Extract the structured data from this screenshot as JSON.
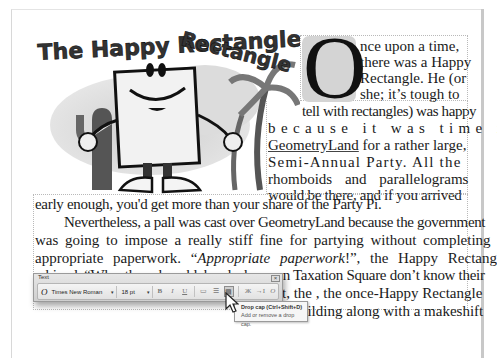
{
  "document": {
    "art_title": "The Happy Rectangle",
    "drop_cap_letter": "O",
    "right_column_lines": [
      "nce upon a time,",
      "there was a Happy",
      "Rectangle. He (or",
      "she; it’s tough to",
      "tell with rectangles) was happy"
    ],
    "mid_column_lines": [
      "because it was time in",
      "GeometryLand for a rather large,",
      "Semi-Annual Party. All the",
      "rhomboids and parallelograms",
      "would be there, and if you arrived"
    ],
    "mid_link_word": "GeometryLand",
    "main_lines": [
      "early enough, you'd get more than your share of the Party Pi.",
      "Nevertheless, a pall was cast over GeometryLand because the government",
      "was going to impose a really stiff fine for partying without completing the",
      "appropriate paperwork.",
      "“",
      "Appropriate paperwork",
      "!”, the Happy Rectangle",
      "whined. “Why, those knuckleheads down on Taxation Square don’t know their",
      "t, the , the once-Happy Rectangle",
      "e building along with a makeshift"
    ]
  },
  "toolbar": {
    "title": "Text",
    "close_label": "×",
    "font_icon": "O",
    "font_name": "Times New Roman",
    "font_size": "18 pt",
    "dropdown_caret": "▾",
    "buttons": [
      {
        "name": "bold-button",
        "glyph": "B"
      },
      {
        "name": "italic-button",
        "glyph": "I"
      },
      {
        "name": "underline-button",
        "glyph": "U"
      },
      {
        "name": "highlight-button",
        "glyph": "▭"
      },
      {
        "name": "bullets-button",
        "glyph": "☰"
      },
      {
        "name": "drop-cap-button",
        "glyph": "▤",
        "active": true
      },
      {
        "name": "symbol-button",
        "glyph": "Ж"
      },
      {
        "name": "indent-button",
        "glyph": "→I"
      },
      {
        "name": "font-color-button",
        "glyph": "O"
      }
    ]
  },
  "tooltip": {
    "title": "Drop cap (Ctrl+Shift+D)",
    "description": "Add or remove a drop cap."
  }
}
